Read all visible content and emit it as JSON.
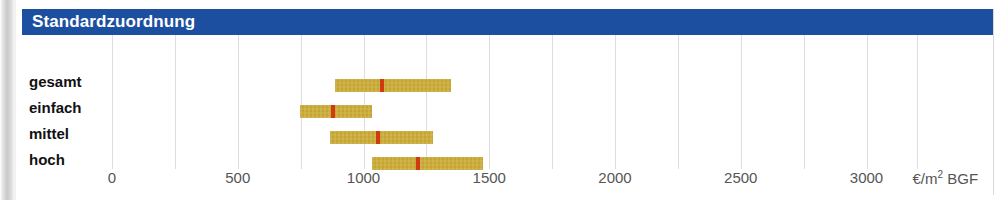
{
  "panel": {
    "title": "Standardzuordnung"
  },
  "chart_data": {
    "type": "bar",
    "title": "Standardzuordnung",
    "xlabel": "€/m² BGF",
    "ylabel": "",
    "xlim": [
      0,
      3200
    ],
    "grid": true,
    "legend": null,
    "orientation": "horizontal",
    "bar_style": "range-with-median-marker",
    "colors": {
      "title_bar": "#1d4fa0",
      "title_text": "#ffffff",
      "range_bar": "#c6a52e",
      "median_marker": "#d03a12",
      "gridline": "#dedede",
      "tick_text": "#555555",
      "row_label": "#111111"
    },
    "ticks": [
      {
        "value": 0,
        "label": "0"
      },
      {
        "value": 500,
        "label": "500"
      },
      {
        "value": 1000,
        "label": "1000"
      },
      {
        "value": 1500,
        "label": "1500"
      },
      {
        "value": 2000,
        "label": "2000"
      },
      {
        "value": 2500,
        "label": "2500"
      },
      {
        "value": 3000,
        "label": "3000"
      }
    ],
    "gridline_values": [
      0,
      250,
      500,
      750,
      1000,
      1250,
      1500,
      1750,
      2000,
      2250,
      2500,
      2750,
      3000,
      3200
    ],
    "axis_unit": "€/m² BGF",
    "categories": [
      "gesamt",
      "einfach",
      "mittel",
      "hoch"
    ],
    "rows": [
      {
        "label": "gesamt",
        "low": 886,
        "median": 1073,
        "high": 1348
      },
      {
        "label": "einfach",
        "low": 747,
        "median": 879,
        "high": 1034
      },
      {
        "label": "mittel",
        "low": 867,
        "median": 1058,
        "high": 1276
      },
      {
        "label": "hoch",
        "low": 1034,
        "median": 1217,
        "high": 1475
      }
    ]
  }
}
